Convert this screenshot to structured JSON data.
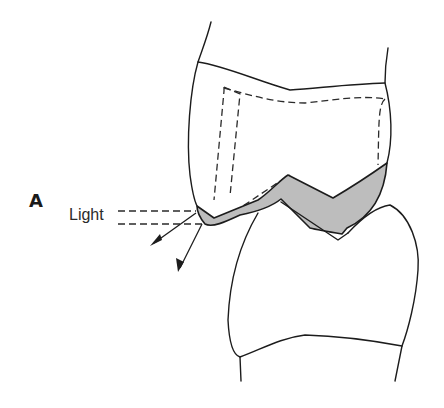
{
  "figure": {
    "panel_label": "A",
    "light_label": "Light"
  },
  "colors": {
    "line": "#1c1c1c",
    "band_fill": "#bdbdbd",
    "background": "#ffffff"
  }
}
